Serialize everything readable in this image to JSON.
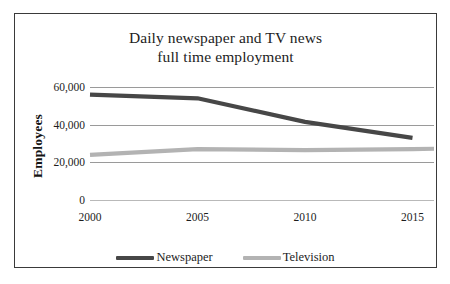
{
  "chart_data": {
    "type": "line",
    "title": "Daily newspaper and TV news full time employment",
    "title_lines": [
      "Daily newspaper and TV news",
      "full time employment"
    ],
    "xlabel": "",
    "ylabel": "Employees",
    "x": [
      2000,
      2005,
      2010,
      2015,
      2016
    ],
    "xtick_labels": [
      "2000",
      "2005",
      "2010",
      "2015",
      "2016"
    ],
    "ytick_labels": [
      "60,000",
      "40,000",
      "20,000",
      "0"
    ],
    "yticks": [
      60000,
      40000,
      20000,
      0
    ],
    "ylim": [
      0,
      60000
    ],
    "xlim": [
      2000,
      2016
    ],
    "grid": true,
    "legend_position": "bottom",
    "series": [
      {
        "name": "Newspaper",
        "color": "#474747",
        "x": [
          2000,
          2005,
          2010,
          2015
        ],
        "values": [
          56000,
          54000,
          41500,
          33000
        ]
      },
      {
        "name": "Television",
        "color": "#b3b3b3",
        "x": [
          2000,
          2005,
          2010,
          2015,
          2016
        ],
        "values": [
          24000,
          27000,
          26500,
          27000,
          27200
        ]
      }
    ]
  },
  "legend": {
    "entries": [
      {
        "label": "Newspaper",
        "color": "#474747"
      },
      {
        "label": "Television",
        "color": "#b3b3b3"
      }
    ]
  },
  "colors": {
    "newspaper": "#474747",
    "television": "#b3b3b3",
    "gridline": "#9a9a9a",
    "border": "#3a3a3a",
    "text": "#1d1d1d"
  }
}
